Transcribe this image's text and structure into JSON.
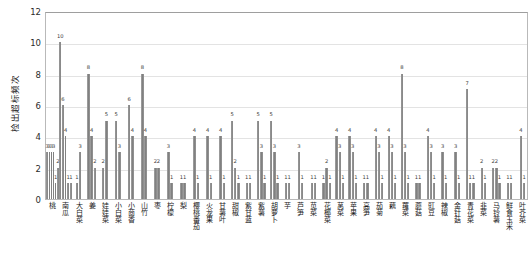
{
  "chart_data": {
    "type": "bar",
    "title": "",
    "xlabel": "",
    "ylabel": "检出超标频次",
    "ylim": [
      0,
      12
    ],
    "yticks": [
      0,
      2,
      4,
      6,
      8,
      10,
      12
    ],
    "grid": true,
    "legend": "none",
    "categories": [
      "桃",
      "南瓜",
      "大白菜",
      "姜",
      "娃娃菜",
      "小白菜",
      "小茴香",
      "山竹",
      "枣",
      "柠檬",
      "梨",
      "樱桃番茄",
      "火龙果",
      "甘薯叶",
      "甜椒",
      "紫甘蓝",
      "紫薯",
      "胡萝卜",
      "芋",
      "芦笋",
      "苋菜",
      "花椰菜",
      "莴菜",
      "苹果",
      "高笋",
      "茄菊",
      "藕",
      "蕹菜",
      "蘑菇",
      "豇豆",
      "辣椒",
      "金针菇",
      "青花菜",
      "韭菜",
      "马铃薯",
      "鲜食玉米",
      "叶芥菜"
    ],
    "groups": [
      {
        "category": "桃",
        "values": [
          3,
          3,
          3,
          3,
          1,
          2
        ]
      },
      {
        "category": "南瓜",
        "values": [
          10,
          6,
          4,
          1,
          1
        ]
      },
      {
        "category": "大白菜",
        "values": [
          1,
          3
        ]
      },
      {
        "category": "姜",
        "values": [
          8,
          4,
          2
        ]
      },
      {
        "category": "娃娃菜",
        "values": [
          2,
          5
        ]
      },
      {
        "category": "小白菜",
        "values": [
          5,
          3
        ]
      },
      {
        "category": "小茴香",
        "values": [
          6,
          4
        ]
      },
      {
        "category": "山竹",
        "values": [
          8,
          4
        ]
      },
      {
        "category": "枣",
        "values": [
          2,
          2
        ]
      },
      {
        "category": "柠檬",
        "values": [
          3,
          1
        ]
      },
      {
        "category": "梨",
        "values": [
          1,
          1
        ]
      },
      {
        "category": "樱桃番茄",
        "values": [
          4,
          1
        ]
      },
      {
        "category": "火龙果",
        "values": [
          4,
          1
        ]
      },
      {
        "category": "甘薯叶",
        "values": [
          4,
          1
        ]
      },
      {
        "category": "甜椒",
        "values": [
          5,
          2,
          1
        ]
      },
      {
        "category": "紫甘蓝",
        "values": [
          1,
          1
        ]
      },
      {
        "category": "紫薯",
        "values": [
          5,
          3,
          1
        ]
      },
      {
        "category": "胡萝卜",
        "values": [
          5,
          3,
          1
        ]
      },
      {
        "category": "芋",
        "values": [
          1,
          1
        ]
      },
      {
        "category": "芦笋",
        "values": [
          3,
          1
        ]
      },
      {
        "category": "苋菜",
        "values": [
          1,
          1
        ]
      },
      {
        "category": "花椰菜",
        "values": [
          1,
          2,
          1
        ]
      },
      {
        "category": "莴菜",
        "values": [
          4,
          3,
          1
        ]
      },
      {
        "category": "苹果",
        "values": [
          4,
          3,
          1
        ]
      },
      {
        "category": "高笋",
        "values": [
          1,
          1
        ]
      },
      {
        "category": "茄菊",
        "values": [
          4,
          3,
          1
        ]
      },
      {
        "category": "藕",
        "values": [
          4,
          3,
          1
        ]
      },
      {
        "category": "蕹菜",
        "values": [
          8,
          3,
          1
        ]
      },
      {
        "category": "蘑菇",
        "values": [
          1,
          1
        ]
      },
      {
        "category": "豇豆",
        "values": [
          4,
          3,
          1
        ]
      },
      {
        "category": "辣椒",
        "values": [
          3,
          1
        ]
      },
      {
        "category": "金针菇",
        "values": [
          3,
          1
        ]
      },
      {
        "category": "青花菜",
        "values": [
          7,
          1,
          1
        ]
      },
      {
        "category": "韭菜",
        "values": [
          2,
          1
        ]
      },
      {
        "category": "马铃薯",
        "values": [
          2,
          2,
          1
        ]
      },
      {
        "category": "鲜食玉米",
        "values": [
          1,
          1
        ]
      },
      {
        "category": "叶芥菜",
        "values": [
          4,
          1
        ]
      }
    ]
  }
}
